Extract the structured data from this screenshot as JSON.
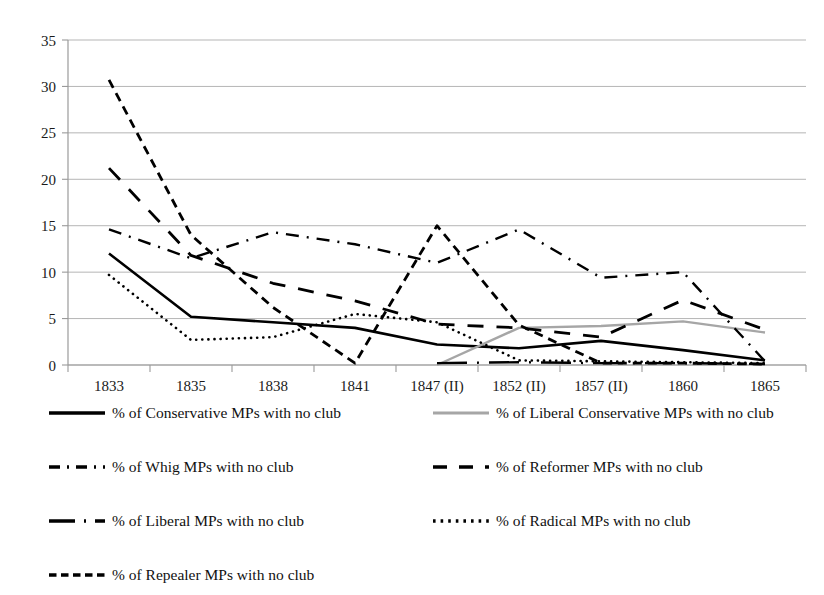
{
  "chart_data": {
    "type": "line",
    "title": "",
    "subtitle": "",
    "xlabel": "",
    "ylabel": "",
    "ylim": [
      0,
      35
    ],
    "ytick_step": 5,
    "yticks": [
      "0",
      "5",
      "10",
      "15",
      "20",
      "25",
      "30",
      "35"
    ],
    "grid": "horizontal",
    "legend_position": "bottom",
    "categories": [
      "1833",
      "1835",
      "1838",
      "1841",
      "1847 (II)",
      "1852 (II)",
      "1857 (II)",
      "1860",
      "1865"
    ],
    "series": [
      {
        "name": "% of Conservative MPs with no club",
        "legend_label": "% of Conservative MPs with no club",
        "style": "solid",
        "color": "#000000",
        "width": 2.6,
        "values": [
          12.0,
          5.2,
          4.6,
          4.0,
          2.2,
          1.8,
          2.6,
          1.6,
          0.5
        ]
      },
      {
        "name": "% of Liberal Conservative MPs with no club",
        "legend_label": "% of Liberal Conservative MPs with no club",
        "style": "solid",
        "color": "#a6a6a6",
        "width": 2.4,
        "values": [
          null,
          null,
          null,
          null,
          0.0,
          4.0,
          4.2,
          4.7,
          3.5
        ]
      },
      {
        "name": "% of Whig MPs with no club",
        "legend_label": "% of Whig MPs with no club",
        "style": "dashdot",
        "color": "#000000",
        "width": 2.4,
        "values": [
          14.6,
          11.5,
          14.3,
          13.0,
          11.0,
          14.6,
          9.4,
          10.0,
          0.4
        ]
      },
      {
        "name": "% of Reformer MPs with no club",
        "legend_label": "% of Reformer MPs with no club",
        "style": "dashed-long",
        "color": "#000000",
        "width": 2.8,
        "values": [
          21.2,
          11.8,
          8.8,
          6.9,
          4.4,
          4.0,
          3.0,
          7.0,
          3.8
        ]
      },
      {
        "name": "% of Liberal MPs with no club",
        "legend_label": "% of Liberal MPs with no club",
        "style": "longdash-dot",
        "color": "#000000",
        "width": 2.4,
        "values": [
          null,
          null,
          null,
          null,
          0.2,
          0.3,
          0.2,
          0.2,
          0.1
        ]
      },
      {
        "name": "% of Radical MPs with no club",
        "legend_label": "% of Radical MPs with no club",
        "style": "dotted",
        "color": "#000000",
        "width": 2.6,
        "values": [
          9.7,
          2.7,
          3.0,
          5.5,
          4.6,
          0.5,
          0.4,
          0.3,
          0.2
        ]
      },
      {
        "name": "% of Repealer MPs with no club",
        "legend_label": "% of Repealer MPs with no club",
        "style": "dashed-short",
        "color": "#000000",
        "width": 2.8,
        "values": [
          30.7,
          14.0,
          6.2,
          0.2,
          15.0,
          4.3,
          0.2,
          0.2,
          0.1
        ]
      }
    ]
  },
  "legend": {
    "rows": [
      {
        "col1": "% of Conservative MPs with no club",
        "col2": "% of Liberal Conservative MPs with no club"
      },
      {
        "col1": "% of Whig MPs with no club",
        "col2": "% of Reformer MPs with no club"
      },
      {
        "col1": "% of Liberal MPs with no club",
        "col2": "% of Radical MPs with no club"
      },
      {
        "col1": "% of Repealer MPs with no club",
        "col2": ""
      }
    ]
  },
  "axis": {
    "y_tick_labels": [
      "35",
      "30",
      "25",
      "20",
      "15",
      "10",
      "5",
      "0"
    ],
    "x_tick_labels": [
      "1833",
      "1835",
      "1838",
      "1841",
      "1847 (II)",
      "1852 (II)",
      "1857 (II)",
      "1860",
      "1865"
    ]
  },
  "colors": {
    "plot_line": "#000000",
    "gray_line": "#a6a6a6",
    "grid": "#b5b5b5",
    "axis": "#9a9a9a",
    "text": "#1a1a1a"
  }
}
